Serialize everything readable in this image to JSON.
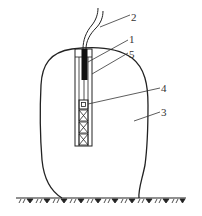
{
  "diagram": {
    "type": "technical-schematic",
    "colors": {
      "stroke": "#222222",
      "rod": "#111111",
      "background": "#ffffff"
    },
    "labels": [
      {
        "id": "label-2",
        "text": "2",
        "x": 133,
        "y": 12,
        "points_to": "cable"
      },
      {
        "id": "label-1",
        "text": "1",
        "x": 131,
        "y": 34,
        "points_to": "rod"
      },
      {
        "id": "label-5",
        "text": "5",
        "x": 131,
        "y": 49,
        "points_to": "tube"
      },
      {
        "id": "label-4",
        "text": "4",
        "x": 163,
        "y": 83,
        "points_to": "sensor-box"
      },
      {
        "id": "label-3",
        "text": "3",
        "x": 163,
        "y": 107,
        "points_to": "mass-body"
      }
    ],
    "components": {
      "cable": "two wires entering top of tube",
      "rod": "solid black rod inside tube top",
      "tube": "vertical tube inserted into mass",
      "sensor_box": "small box at top of lattice section",
      "lattice": "cross-braced section of 3 X-cells",
      "mass_body": "rounded blob-shaped body resting on ground",
      "ground": "hatched ground line"
    }
  }
}
